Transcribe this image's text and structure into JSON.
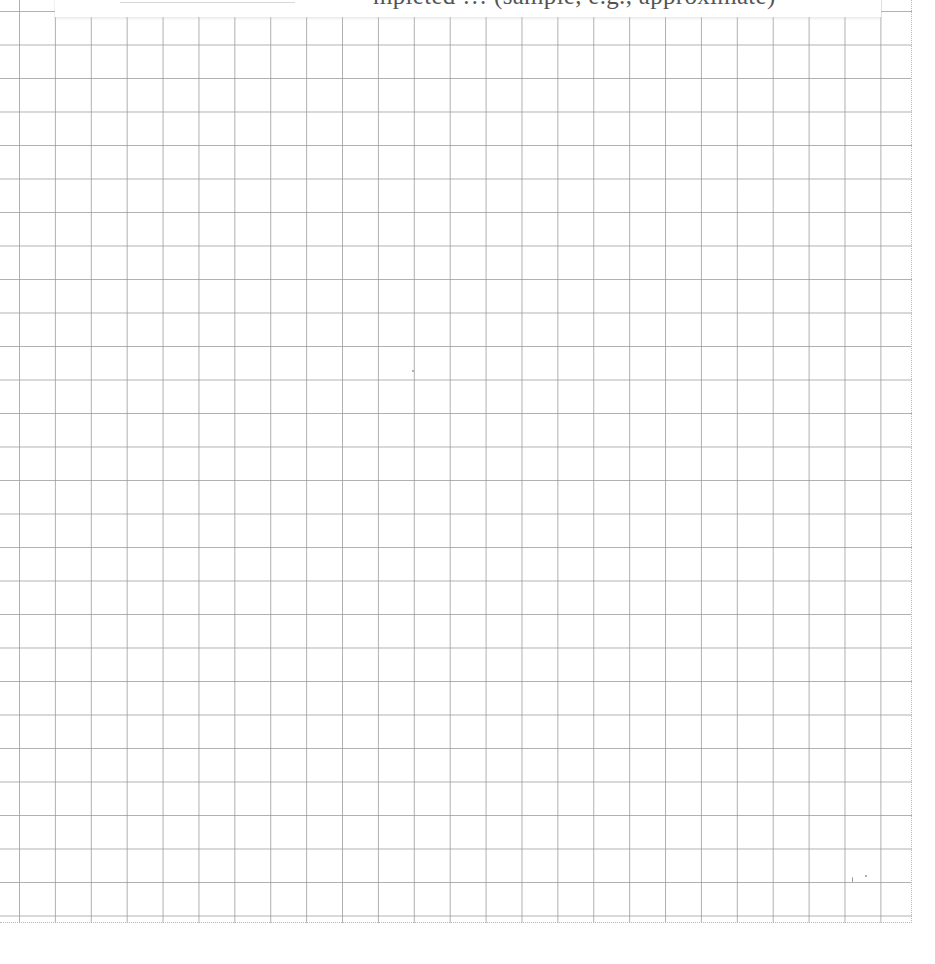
{
  "page": {
    "type": "graph-paper worksheet",
    "grid": {
      "columns": 25,
      "rows": 27,
      "cell_width_px": 35.9,
      "cell_height_px": 33.5,
      "line_color": "#969696",
      "border_style": "dotted"
    }
  },
  "header": {
    "blank_line": "",
    "text": "mpleted … (sample, e.g., approximate)"
  }
}
